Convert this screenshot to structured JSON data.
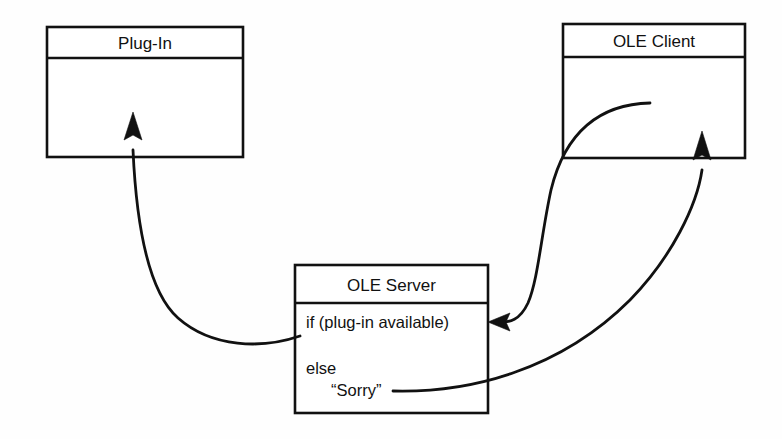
{
  "diagram": {
    "stroke_color": "#111111",
    "background_color": "#ffffff",
    "nodes": [
      {
        "id": "plugin",
        "title": "Plug-In",
        "body_lines": []
      },
      {
        "id": "ole_client",
        "title": "OLE Client",
        "body_lines": []
      },
      {
        "id": "ole_server",
        "title": "OLE Server",
        "body_lines": [
          "if (plug-in available)",
          "else",
          "“Sorry”"
        ]
      }
    ],
    "connectors": [
      {
        "id": "client-to-server",
        "from": "ole_client",
        "to": "ole_server",
        "arrow": "arrowhead-left"
      },
      {
        "id": "server-to-plugin",
        "from": "ole_server",
        "to": "plugin",
        "arrow": "arrowhead-up"
      },
      {
        "id": "sorry-to-client",
        "from": "ole_server",
        "to": "ole_client",
        "arrow": "arrowhead-up"
      }
    ]
  }
}
